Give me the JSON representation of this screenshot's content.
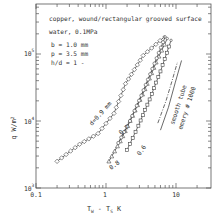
{
  "chart_data": {
    "type": "line",
    "title": "copper, wound/rectangular grooved surface",
    "subtitle": "water, 0.1MPa",
    "annotations": [
      "b = 1.0 mm",
      "p = 3.5 mm",
      "h/d = 1 -"
    ],
    "xlabel": "T_W - T_S  K",
    "ylabel": "q  W/m^2",
    "xscale": "log",
    "yscale": "log",
    "xlim": [
      0.1,
      25
    ],
    "ylim": [
      1000,
      500000
    ],
    "x_ticks": [
      "0.1",
      "1",
      "10"
    ],
    "y_ticks": [
      "10^3",
      "10^4",
      "10^5"
    ],
    "grid": false,
    "legend": "inline labels",
    "series": [
      {
        "name": "d=0.9 mm",
        "marker": "diamond",
        "x": [
          0.2,
          0.42,
          0.77,
          1.3,
          1.9,
          3.4,
          6.8
        ],
        "y": [
          2500,
          4500,
          6500,
          13000,
          36000,
          95000,
          180000
        ]
      },
      {
        "name": "0.8",
        "marker": "triangle",
        "x": [
          1.1,
          1.6,
          2.4,
          3.6,
          5.2,
          7.5
        ],
        "y": [
          2500,
          5000,
          12000,
          30000,
          75000,
          170000
        ]
      },
      {
        "name": "0.7",
        "marker": "circle",
        "x": [
          1.5,
          2.2,
          3.2,
          4.6,
          7.0
        ],
        "y": [
          4700,
          10000,
          24000,
          60000,
          180000
        ]
      },
      {
        "name": "0.6",
        "marker": "square",
        "x": [
          2.0,
          2.9,
          4.2,
          6.0,
          8.5
        ],
        "y": [
          3700,
          8500,
          21000,
          55000,
          160000
        ]
      },
      {
        "name": "smooth tube",
        "marker": "none",
        "x": [
          5.5,
          7.2,
          8.8,
          10.5
        ],
        "y": [
          9300,
          20000,
          40000,
          76000
        ]
      },
      {
        "name": "emery # 1000",
        "marker": "none",
        "x": [
          6.0,
          7.8,
          9.8,
          12.0
        ],
        "y": [
          7300,
          16000,
          38000,
          80000
        ]
      }
    ]
  },
  "text": {
    "title": "copper, wound/rectangular grooved surface",
    "subtitle": "water, 0.1MPa",
    "param_b": "b = 1.0 mm",
    "param_p": "p = 3.5 mm",
    "param_hd": "h/d = 1 -",
    "xlabel": "T",
    "xlabel_sub_w": "W",
    "xlabel_mid": " - T",
    "xlabel_sub_s": "S",
    "xlabel_unit": "  K",
    "ylabel": "q  W/m",
    "ylabel_sup": "2",
    "xt_01": "0.1",
    "xt_1": "1",
    "xt_10": "10",
    "yt_base": "10",
    "yt_3": "3",
    "yt_4": "4",
    "yt_5": "5",
    "lab_d09": "d=0.9 mm",
    "lab_08": "0.8",
    "lab_07": "0.7",
    "lab_06": "0.6",
    "lab_smooth": "smooth tube",
    "lab_emery": "emery # 1000"
  }
}
